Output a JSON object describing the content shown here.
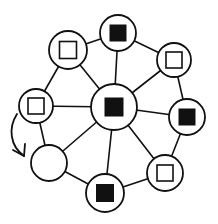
{
  "diagram": {
    "type": "network",
    "colors": {
      "stroke": "#111111",
      "background": "#ffffff"
    },
    "nodes": [
      {
        "id": "center",
        "x": 114,
        "y": 107,
        "r": 23,
        "marker": "filled-square",
        "size": 18
      },
      {
        "id": "top",
        "x": 118,
        "y": 33,
        "r": 18,
        "marker": "filled-square",
        "size": 16
      },
      {
        "id": "top-right",
        "x": 174,
        "y": 60,
        "r": 17,
        "marker": "hollow-square",
        "size": 16
      },
      {
        "id": "right",
        "x": 187,
        "y": 117,
        "r": 18,
        "marker": "filled-square",
        "size": 16
      },
      {
        "id": "bottom-right",
        "x": 165,
        "y": 173,
        "r": 18,
        "marker": "hollow-square",
        "size": 16
      },
      {
        "id": "bottom",
        "x": 105,
        "y": 193,
        "r": 19,
        "marker": "filled-square",
        "size": 17
      },
      {
        "id": "bottom-left",
        "x": 49,
        "y": 163,
        "r": 18,
        "marker": "empty",
        "size": 0
      },
      {
        "id": "left",
        "x": 36,
        "y": 106,
        "r": 17,
        "marker": "hollow-square",
        "size": 16
      },
      {
        "id": "top-left",
        "x": 68,
        "y": 50,
        "r": 19,
        "marker": "hollow-square",
        "size": 17
      }
    ],
    "edges": [
      [
        "center",
        "top"
      ],
      [
        "center",
        "top-right"
      ],
      [
        "center",
        "right"
      ],
      [
        "center",
        "bottom-right"
      ],
      [
        "center",
        "bottom"
      ],
      [
        "center",
        "bottom-left"
      ],
      [
        "center",
        "left"
      ],
      [
        "center",
        "top-left"
      ],
      [
        "top",
        "top-right"
      ],
      [
        "top-right",
        "right"
      ],
      [
        "right",
        "bottom-right"
      ],
      [
        "bottom-right",
        "bottom"
      ],
      [
        "bottom",
        "bottom-left"
      ],
      [
        "bottom-left",
        "left"
      ],
      [
        "left",
        "top-left"
      ],
      [
        "top-left",
        "top"
      ]
    ],
    "arrow": {
      "from": "left",
      "to": "bottom-left",
      "path": "M 17 114 C 8 128, 10 146, 24 156",
      "head": [
        [
          13,
          150
        ],
        [
          24,
          156
        ],
        [
          25,
          144
        ]
      ]
    }
  }
}
